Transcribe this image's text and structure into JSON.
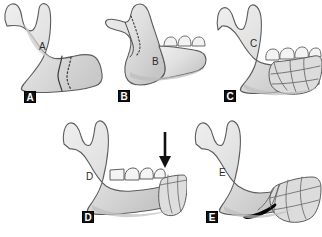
{
  "figure": {
    "background_color": "#ffffff",
    "bone_fill_light": "#e8e8e8",
    "bone_fill_mid": "#d4d4d4",
    "bone_fill_shadow": "#bdbdbd",
    "outline_color": "#555555",
    "marking_color": "#333333",
    "badge_background": "#111111",
    "badge_text_color": "#ffffff",
    "inner_label_color": "#2b2b2b"
  },
  "panels": [
    {
      "id": "A",
      "badge_label": "A",
      "inner_label": "A",
      "description": "Intact mandible with solid and dotted resection lines at the body",
      "markings": [
        "solid-resection-line",
        "dotted-resection-line"
      ],
      "has_teeth": false,
      "has_arrow": false,
      "has_graft": false,
      "has_black_wedge": false
    },
    {
      "id": "B",
      "badge_label": "B",
      "inner_label": "B",
      "description": "Mandible with posterior teeth and dotted osteotomy line across the ramus",
      "markings": [
        "dotted-osteotomy-line"
      ],
      "has_teeth": true,
      "has_arrow": false,
      "has_graft": false,
      "has_black_wedge": false
    },
    {
      "id": "C",
      "badge_label": "C",
      "inner_label": "C",
      "description": "Mandible with segmented bone graft blocks reconstructing the posterior body and ramus",
      "markings": [
        "graft-segment-lines"
      ],
      "has_teeth": true,
      "has_arrow": false,
      "has_graft": true,
      "has_black_wedge": false
    },
    {
      "id": "D",
      "badge_label": "D",
      "inner_label": "D",
      "description": "Mandible with dentition and a downward arrow indicating loading force at the graft junction",
      "markings": [
        "down-arrow"
      ],
      "has_teeth": true,
      "has_arrow": true,
      "has_graft": true,
      "has_black_wedge": false
    },
    {
      "id": "E",
      "badge_label": "E",
      "inner_label": "E",
      "description": "Mandible with posterior graft mass and a black wedge-shaped defect at the inferior border",
      "markings": [
        "black-wedge-defect",
        "graft-segment-lines"
      ],
      "has_teeth": false,
      "has_arrow": false,
      "has_graft": true,
      "has_black_wedge": true
    }
  ]
}
